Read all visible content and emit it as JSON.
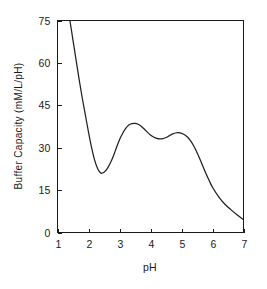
{
  "chart_data": {
    "type": "line",
    "title": "",
    "xlabel": "pH",
    "ylabel": "Buffer Capacity  (mM/L/pH)",
    "xlim": [
      1,
      7
    ],
    "ylim": [
      0,
      75
    ],
    "xticks": [
      1,
      2,
      3,
      4,
      5,
      6,
      7
    ],
    "xtick_labels": [
      "1",
      "2",
      "3",
      "4",
      "5",
      "6",
      "7"
    ],
    "yticks": [
      0,
      15,
      30,
      45,
      60,
      75
    ],
    "ytick_labels": [
      "0",
      "15",
      "30",
      "45",
      "60",
      "75"
    ],
    "grid": false,
    "legend": false,
    "legend_position": "none",
    "series": [
      {
        "name": "Buffer capacity",
        "color": "#202020",
        "x": [
          1.4,
          1.5,
          1.6,
          1.7,
          1.8,
          1.9,
          2.0,
          2.1,
          2.2,
          2.3,
          2.4,
          2.5,
          2.6,
          2.7,
          2.8,
          2.9,
          3.0,
          3.1,
          3.2,
          3.3,
          3.4,
          3.5,
          3.6,
          3.7,
          3.8,
          3.9,
          4.0,
          4.1,
          4.2,
          4.3,
          4.4,
          4.5,
          4.6,
          4.7,
          4.8,
          4.9,
          5.0,
          5.1,
          5.2,
          5.3,
          5.4,
          5.5,
          5.6,
          5.7,
          5.8,
          5.9,
          6.0,
          6.2,
          6.4,
          6.6,
          6.8,
          7.0
        ],
        "y": [
          75.0,
          68.0,
          61.0,
          54.0,
          47.5,
          41.5,
          35.5,
          30.0,
          25.5,
          22.5,
          21.0,
          21.3,
          22.5,
          24.5,
          27.0,
          30.0,
          32.8,
          35.0,
          36.8,
          38.0,
          38.5,
          38.6,
          38.3,
          37.6,
          36.6,
          35.5,
          34.5,
          33.8,
          33.3,
          33.1,
          33.2,
          33.6,
          34.2,
          34.8,
          35.2,
          35.3,
          35.1,
          34.6,
          33.7,
          32.3,
          30.5,
          28.3,
          25.8,
          23.2,
          20.6,
          18.2,
          16.0,
          12.6,
          10.0,
          8.0,
          6.2,
          4.5
        ]
      }
    ],
    "annotations": []
  },
  "axis_labels": {
    "y_axis_title": "Buffer  Capacity  (mM/L/pH)",
    "x_axis_title": "pH"
  }
}
